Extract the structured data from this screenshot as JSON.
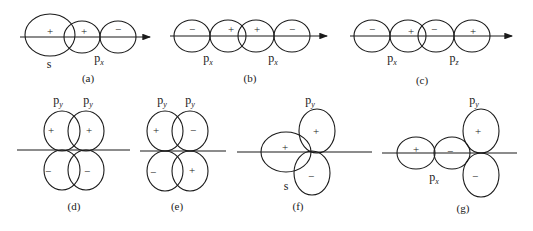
{
  "figure": {
    "panels": [
      {
        "id": "a",
        "caption": "(a)",
        "labels": [
          {
            "base": "s",
            "sub": ""
          },
          {
            "base": "p",
            "sub": "x"
          }
        ],
        "signs": [
          "+",
          "+",
          "−"
        ]
      },
      {
        "id": "b",
        "caption": "(b)",
        "labels": [
          {
            "base": "p",
            "sub": "x"
          },
          {
            "base": "p",
            "sub": "x"
          }
        ],
        "signs": [
          "−",
          "+",
          "+",
          "−"
        ]
      },
      {
        "id": "c",
        "caption": "(c)",
        "labels": [
          {
            "base": "p",
            "sub": "x"
          },
          {
            "base": "p",
            "sub": "z"
          }
        ],
        "signs": [
          "−",
          "+",
          "−",
          "+"
        ]
      },
      {
        "id": "d",
        "caption": "(d)",
        "labels": [
          {
            "base": "p",
            "sub": "y"
          },
          {
            "base": "p",
            "sub": "y"
          }
        ],
        "signs": [
          "+",
          "+",
          "−",
          "−"
        ]
      },
      {
        "id": "e",
        "caption": "(e)",
        "labels": [
          {
            "base": "p",
            "sub": "y"
          },
          {
            "base": "p",
            "sub": "y"
          }
        ],
        "signs": [
          "+",
          "−",
          "−",
          "+"
        ]
      },
      {
        "id": "f",
        "caption": "(f)",
        "labels": [
          {
            "base": "p",
            "sub": "y"
          },
          {
            "base": "s",
            "sub": ""
          }
        ],
        "signs": [
          "+",
          "+",
          "−"
        ]
      },
      {
        "id": "g",
        "caption": "(g)",
        "labels": [
          {
            "base": "p",
            "sub": "y"
          },
          {
            "base": "p",
            "sub": "x"
          }
        ],
        "signs": [
          "+",
          "−",
          "+",
          "−"
        ]
      }
    ]
  }
}
